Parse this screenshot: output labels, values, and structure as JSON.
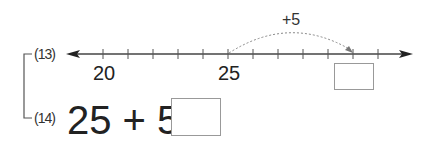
{
  "problems": [
    {
      "number": "(13)",
      "type": "number-line"
    },
    {
      "number": "(14)",
      "type": "equation"
    }
  ],
  "number_line": {
    "start": 20,
    "labels": [
      {
        "value": "20",
        "x": 103
      },
      {
        "value": "25",
        "x": 228
      }
    ],
    "tick_positions": [
      103,
      128,
      153,
      178,
      203,
      228,
      253,
      278,
      303,
      328,
      353,
      378
    ],
    "jump": {
      "label": "+5",
      "from": 25,
      "to": 30
    },
    "answer_box": ""
  },
  "equation": {
    "expression": "25 + 5 =",
    "answer_box": ""
  }
}
